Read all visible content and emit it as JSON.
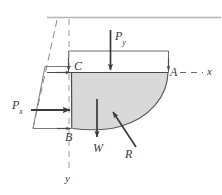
{
  "figure": {
    "colors": {
      "line": "#3f3f3f",
      "thin_line": "#8a8a8a",
      "fill": "#d9d9d9",
      "arrow": "#3a3a3a",
      "background": "#ffffff",
      "surface_line": "#b4b4b4"
    },
    "labels": {
      "point_c": "C",
      "point_a": "A",
      "point_b": "B",
      "axis_x": "x",
      "axis_y": "y",
      "force_px_base": "P",
      "force_px_sub": "x",
      "force_py_base": "P",
      "force_py_sub": "y",
      "weight": "W",
      "resultant": "R"
    },
    "elements": {
      "free_surface": "free-surface-line",
      "shaded_body": "shaded-fluid-body",
      "curved_surface": "curved-surface-arc",
      "pressure_prism": "pressure-distribution-parallelogram",
      "top_rectangle": "vertical-pressure-rectangle",
      "centerline": "vertical-dashed-centerline"
    }
  }
}
